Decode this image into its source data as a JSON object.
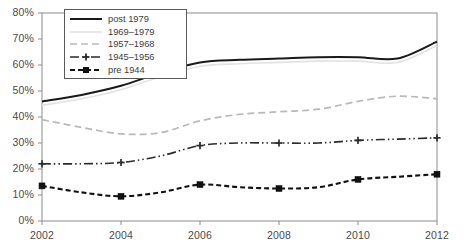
{
  "chart_data": {
    "type": "line",
    "title": "",
    "xlabel": "",
    "ylabel": "",
    "x": [
      2002,
      2003,
      2004,
      2005,
      2006,
      2007,
      2008,
      2009,
      2010,
      2011,
      2012
    ],
    "xlim": [
      2002,
      2012
    ],
    "ylim": [
      0,
      80
    ],
    "xticks": [
      "2002",
      "2004",
      "2006",
      "2008",
      "2010",
      "2012"
    ],
    "xtick_values": [
      2002,
      2004,
      2006,
      2008,
      2010,
      2012
    ],
    "yticks": [
      "0%",
      "10%",
      "20%",
      "30%",
      "40%",
      "50%",
      "60%",
      "70%",
      "80%"
    ],
    "ytick_values": [
      0,
      10,
      20,
      30,
      40,
      50,
      60,
      70,
      80
    ],
    "grid": false,
    "legend_position": "top-left",
    "series": [
      {
        "name": "post 1979",
        "style": "solid",
        "color": "#1a1a1a",
        "marker": "none",
        "values": [
          46.0,
          48.5,
          52.0,
          57.0,
          61.0,
          62.0,
          62.5,
          63.0,
          63.0,
          62.5,
          69.0
        ]
      },
      {
        "name": "1969–1979",
        "style": "solid-faint",
        "color": "#e2e2e2",
        "marker": "none",
        "values": [
          44.5,
          47.0,
          50.5,
          55.5,
          59.5,
          60.5,
          61.0,
          61.5,
          61.5,
          61.0,
          67.5
        ]
      },
      {
        "name": "1957–1968",
        "style": "dashed",
        "color": "#b9b9b9",
        "marker": "none",
        "values": [
          39.0,
          36.0,
          33.5,
          34.0,
          38.5,
          41.0,
          42.0,
          43.0,
          46.0,
          48.0,
          47.0
        ]
      },
      {
        "name": "1945–1956",
        "style": "dash-dot-dot",
        "color": "#2b2b2b",
        "marker": "cross",
        "values": [
          22.0,
          22.0,
          22.5,
          25.0,
          29.0,
          30.0,
          30.0,
          30.0,
          31.0,
          31.5,
          32.0
        ]
      },
      {
        "name": "pre 1944",
        "style": "dashed-bold",
        "color": "#111111",
        "marker": "square",
        "values": [
          13.5,
          11.0,
          9.5,
          11.0,
          14.0,
          13.0,
          12.5,
          13.0,
          16.0,
          17.0,
          18.0
        ]
      }
    ]
  }
}
